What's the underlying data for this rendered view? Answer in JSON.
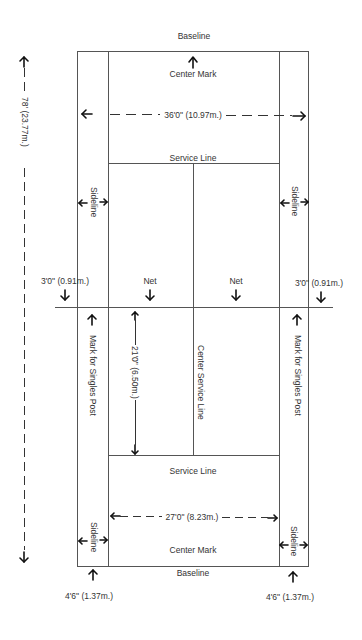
{
  "diagram": {
    "labels": {
      "baseline_top": "Baseline",
      "center_mark_top": "Center Mark",
      "width_doubles": "36'0\" (10.97m.)",
      "service_line_top": "Service Line",
      "sideline_left_top": "Sideline",
      "sideline_right_top": "Sideline",
      "length_total": "78' (23.77m.)",
      "net_ext_left": "3'0\" (0.91m.)",
      "net_ext_right": "3'0\" (0.91m.)",
      "net_left": "Net",
      "net_right": "Net",
      "singles_post_left": "Mark for Singles Post",
      "singles_post_right": "Mark for Singles Post",
      "service_box_length": "21'0\" (6.50m.)",
      "center_service_line": "Center Service Line",
      "service_line_bottom": "Service Line",
      "width_singles": "27'0\" (8.23m.)",
      "sideline_left_bottom": "Sideline",
      "sideline_right_bottom": "Sideline",
      "center_mark_bottom": "Center Mark",
      "baseline_bottom": "Baseline",
      "alley_left": "4'6\" (1.37m.)",
      "alley_right": "4'6\" (1.37m.)"
    },
    "colors": {
      "line": "#555555",
      "arrow": "#111111",
      "text": "#333333"
    }
  }
}
